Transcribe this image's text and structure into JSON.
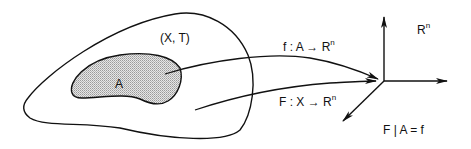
{
  "diagram": {
    "space_label": "(X, T)",
    "subset_label": "A",
    "target_label": "R",
    "target_sup": "n",
    "map_f": {
      "prefix": "f : A → R",
      "sup": "n"
    },
    "map_F": {
      "prefix": "F : X → R",
      "sup": "n"
    },
    "restriction": "F | A = f"
  },
  "colors": {
    "stroke": "#111111",
    "subset_fill": "#cfcfcf",
    "background": "#ffffff"
  }
}
